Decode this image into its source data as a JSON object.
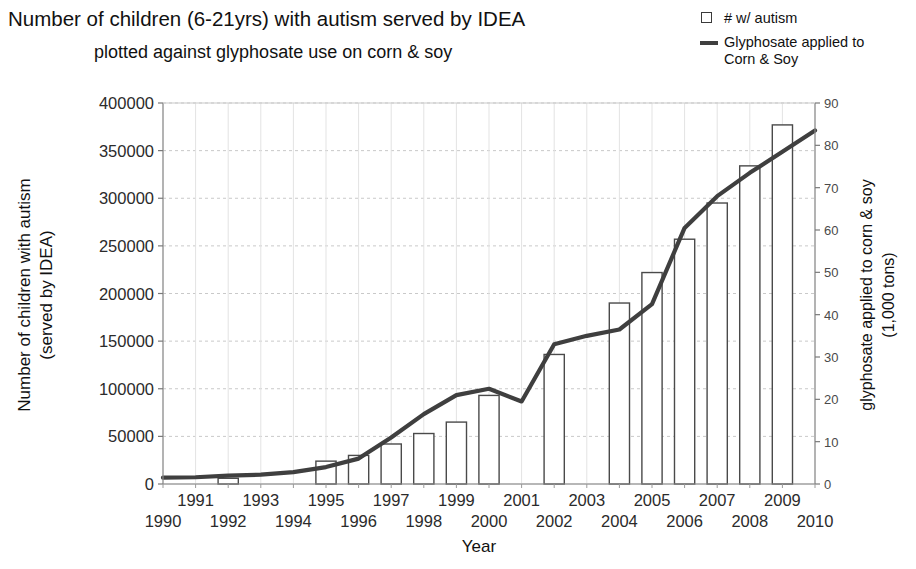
{
  "title": {
    "line1": "Number of children (6-21yrs) with autism served by IDEA",
    "line2": "plotted against glyphosate use on corn & soy"
  },
  "legend": {
    "items": [
      {
        "key": "square",
        "label": "# w/ autism",
        "label_cont": ""
      },
      {
        "key": "line",
        "label": "Glyphosate applied to",
        "label_cont": "Corn & Soy"
      }
    ]
  },
  "chart_data": {
    "type": "bar",
    "title": "Number of children (6-21yrs) with autism served by IDEA plotted against glyphosate use on corn & soy",
    "xlabel": "Year",
    "ylabel": "Number of children with autism (served by IDEA)",
    "y2label": "glyphosate applied to corn & soy (1,000 tons)",
    "grid": true,
    "legend_position": "top-right",
    "categories": [
      "1990",
      "1991",
      "1992",
      "1993",
      "1994",
      "1995",
      "1996",
      "1997",
      "1998",
      "1999",
      "2000",
      "2001",
      "2002",
      "2003",
      "2004",
      "2005",
      "2006",
      "2007",
      "2008",
      "2009",
      "2010"
    ],
    "x": [
      1990,
      1991,
      1992,
      1993,
      1994,
      1995,
      1996,
      1997,
      1998,
      1999,
      2000,
      2001,
      2002,
      2003,
      2004,
      2005,
      2006,
      2007,
      2008,
      2009,
      2010
    ],
    "ylim": [
      0,
      400000
    ],
    "yticks": [
      0,
      50000,
      100000,
      150000,
      200000,
      250000,
      300000,
      350000,
      400000
    ],
    "ytick_labels": [
      "0",
      "50000",
      "100000",
      "150000",
      "200000",
      "250000",
      "300000",
      "350000",
      "400000"
    ],
    "y2lim": [
      0,
      90
    ],
    "y2ticks": [
      0,
      10,
      20,
      30,
      40,
      50,
      60,
      70,
      80,
      90
    ],
    "y2tick_labels": [
      "0",
      "10",
      "20",
      "30",
      "40",
      "50",
      "60",
      "70",
      "80",
      "90"
    ],
    "xtick_labels_top": [
      "1991",
      "1993",
      "1995",
      "1997",
      "1999",
      "2001",
      "2003",
      "2005",
      "2007",
      "2009"
    ],
    "xtick_labels_bottom": [
      "1990",
      "1992",
      "1994",
      "1996",
      "1998",
      "2000",
      "2002",
      "2004",
      "2006",
      "2008",
      "2010"
    ],
    "series": [
      {
        "name": "# w/ autism",
        "type": "bar",
        "axis": "left",
        "fill": "#ffffff",
        "stroke": "#4a4a4a",
        "values": [
          null,
          null,
          6000,
          null,
          null,
          24000,
          30000,
          42000,
          53000,
          65000,
          93000,
          null,
          136000,
          null,
          190000,
          222000,
          257000,
          295000,
          334000,
          377000,
          null
        ]
      },
      {
        "name": "Glyphosate applied to Corn & Soy",
        "type": "line",
        "axis": "right",
        "stroke": "#3f3f3f",
        "values": [
          1.5,
          1.6,
          2.0,
          2.2,
          2.8,
          4.0,
          6.0,
          11.0,
          16.5,
          21.0,
          22.5,
          19.5,
          33.0,
          35.0,
          36.5,
          42.5,
          60.5,
          68.0,
          73.5,
          78.5,
          83.5
        ]
      }
    ]
  },
  "axes": {
    "x_axis_title": "Year",
    "y_axis_title_line1": "Number of children with autism",
    "y_axis_title_line2": "(served by IDEA)",
    "y2_axis_title_line1": "glyphosate applied to corn & soy",
    "y2_axis_title_line2": "(1,000 tons)"
  }
}
